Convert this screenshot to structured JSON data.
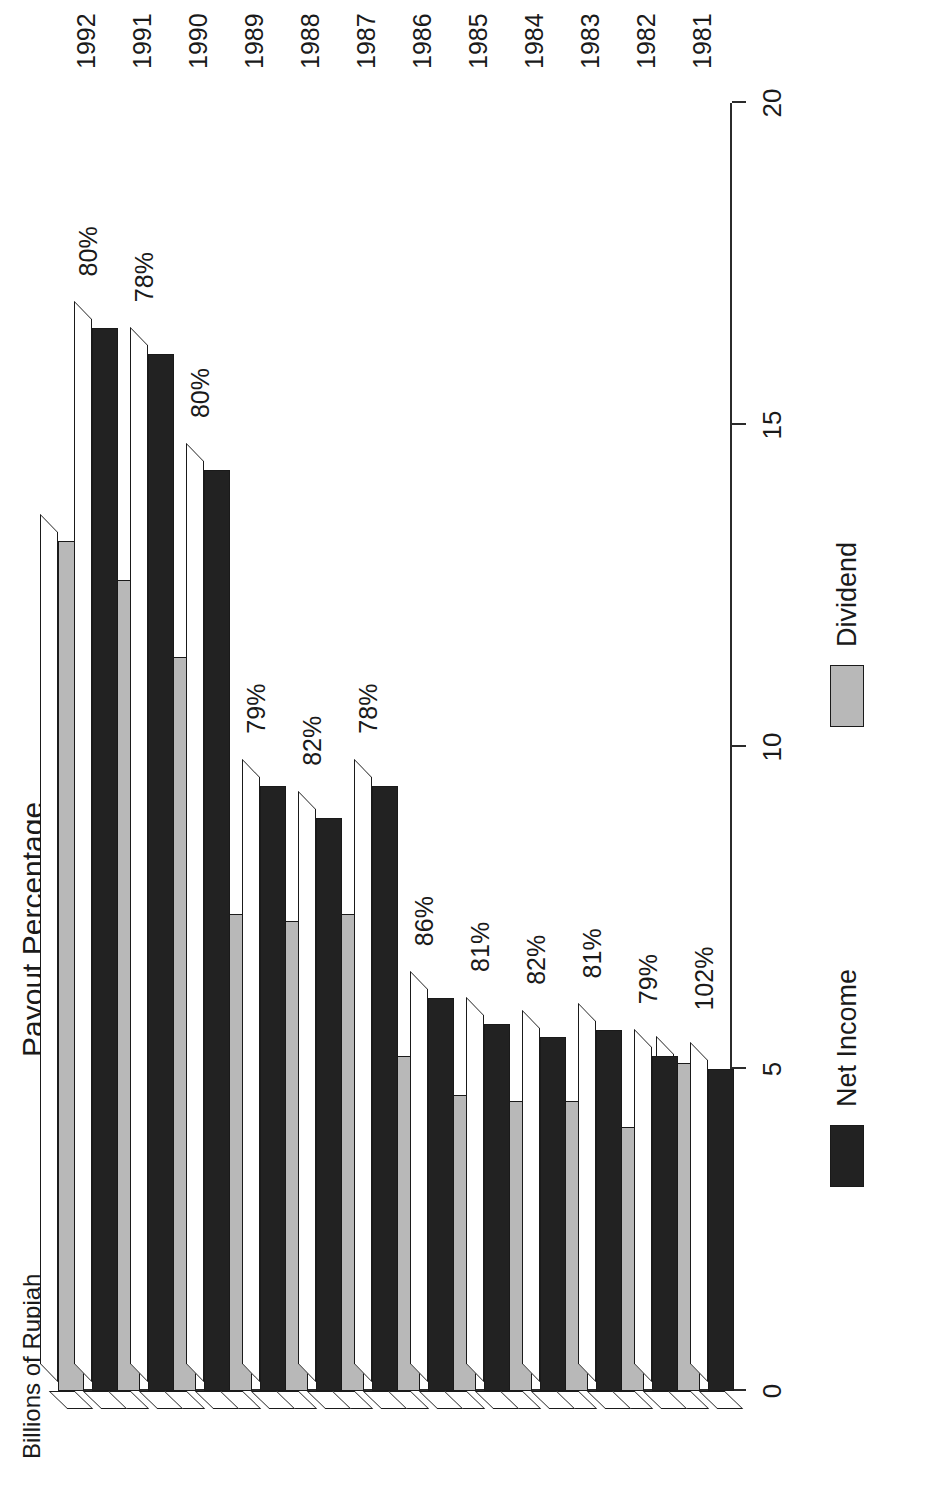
{
  "chart_data": {
    "type": "bar",
    "title": "",
    "ylabel": "Billions of Rupiah",
    "secondary_label": "Payout Percentage",
    "xlabel": "",
    "orientation": "vertical-bars-rotated-90",
    "ylim": [
      0,
      20
    ],
    "yticks": [
      0,
      5,
      10,
      15,
      20
    ],
    "ytick_labels": [
      "0",
      "5",
      "10",
      "15",
      "20"
    ],
    "grid": false,
    "legend_position": "bottom",
    "categories": [
      "1981",
      "1982",
      "1983",
      "1984",
      "1985",
      "1986",
      "1987",
      "1988",
      "1989",
      "1990",
      "1991",
      "1992"
    ],
    "series": [
      {
        "name": "Net Income",
        "color": "#222222",
        "values": [
          5.0,
          5.2,
          5.6,
          5.5,
          5.7,
          6.1,
          9.4,
          8.9,
          9.4,
          14.3,
          16.1,
          16.5
        ]
      },
      {
        "name": "Dividend",
        "color": "#b8b8b8",
        "values": [
          5.1,
          4.1,
          4.5,
          4.5,
          4.6,
          5.2,
          7.4,
          7.3,
          7.4,
          11.4,
          12.6,
          13.2
        ]
      }
    ],
    "annotations": {
      "label": "Payout Percentage",
      "values": [
        "102%",
        "79%",
        "81%",
        "82%",
        "81%",
        "86%",
        "78%",
        "82%",
        "79%",
        "80%",
        "78%",
        "80%"
      ]
    }
  },
  "legend": {
    "items": [
      {
        "label": "Net Income",
        "swatch": "black-swatch"
      },
      {
        "label": "Dividend",
        "swatch": "gray-swatch"
      }
    ]
  }
}
